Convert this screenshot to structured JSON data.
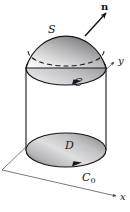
{
  "figure": {
    "labels": {
      "surface": "S",
      "normal": "n",
      "curve": "C",
      "disk": "D",
      "base_curve": "C",
      "base_curve_sub": "0",
      "axis_y": "y",
      "axis_x": "x"
    },
    "caption": ""
  },
  "colors": {
    "outline": "#17161a",
    "axis": "#5a5a5f",
    "background": "#ffffff",
    "shade_dark": "#6f6f72",
    "shade_mid": "#a8a8ab",
    "shade_light": "#efeff0"
  },
  "geometry": {
    "cylinder": {
      "left_x": 26,
      "right_x": 106,
      "top_y": 68,
      "bottom_y": 150
    },
    "dome": {
      "apex_y": 23,
      "rim_y": 68
    },
    "bottom_disk": {
      "center_x": 66,
      "center_y": 150,
      "rx": 40,
      "ry": 17
    },
    "axis_origin": {
      "x": 2,
      "y": 170
    }
  }
}
